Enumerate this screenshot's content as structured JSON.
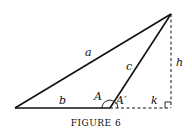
{
  "figure": {
    "caption": "Figure 6",
    "caption_display": "FIGURE 6",
    "labels": {
      "a": "a",
      "b": "b",
      "c": "c",
      "h": "h",
      "k": "k",
      "A": "A",
      "A_prime": "A′"
    },
    "vertices": {
      "left": [
        15,
        108
      ],
      "middle": [
        110,
        108
      ],
      "top": [
        171,
        14
      ],
      "foot": [
        171,
        108
      ]
    }
  }
}
